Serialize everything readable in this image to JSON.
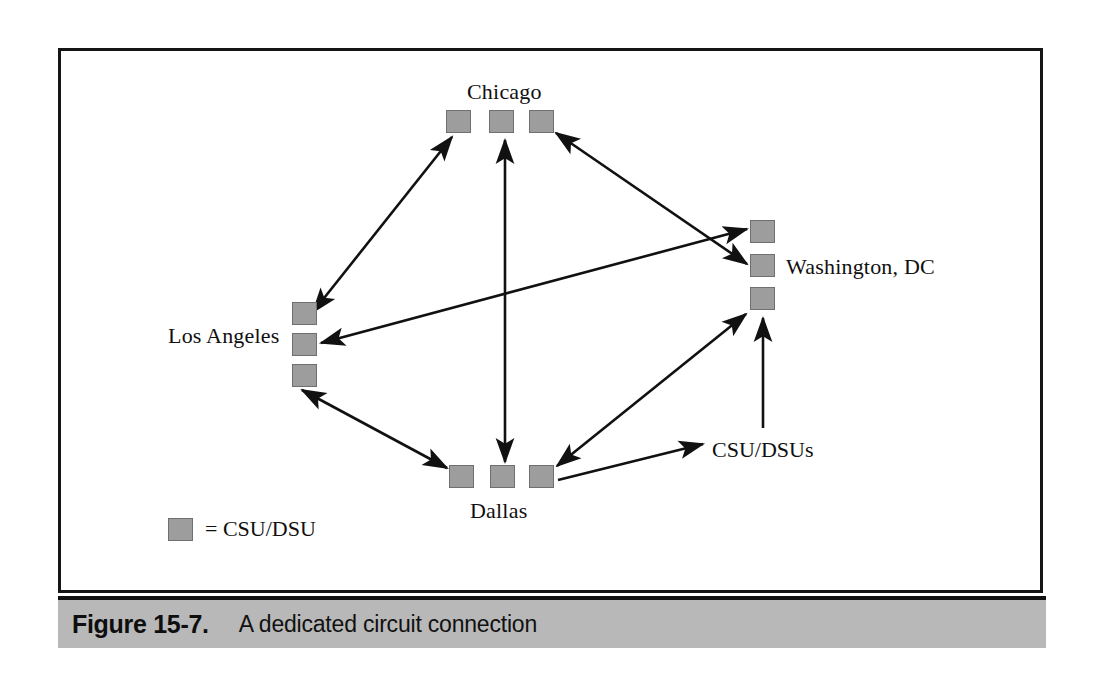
{
  "figure": {
    "caption_number": "Figure 15-7.",
    "caption_text": "A dedicated circuit connection"
  },
  "legend": {
    "swatch_icon": "gray-square-icon",
    "text": "= CSU/DSU"
  },
  "callout": {
    "label": "CSU/DSUs"
  },
  "diagram": {
    "type": "network-topology",
    "node_shape": "square",
    "node_color": "#9d9d9d",
    "node_border_color": "#6f6f6f",
    "line_color": "#111111",
    "sites": [
      {
        "id": "chicago",
        "label": "Chicago",
        "label_position": "above",
        "label_x": 467,
        "label_y": 79,
        "orientation": "horizontal",
        "devices": [
          {
            "x": 446,
            "y": 110
          },
          {
            "x": 489,
            "y": 110
          },
          {
            "x": 529,
            "y": 110
          }
        ]
      },
      {
        "id": "washington-dc",
        "label": "Washington, DC",
        "label_position": "right",
        "label_x": 786,
        "label_y": 254,
        "orientation": "vertical",
        "devices": [
          {
            "x": 750,
            "y": 220
          },
          {
            "x": 750,
            "y": 254
          },
          {
            "x": 750,
            "y": 287
          }
        ]
      },
      {
        "id": "los-angeles",
        "label": "Los Angeles",
        "label_position": "left",
        "label_x": 168,
        "label_y": 323,
        "orientation": "vertical",
        "devices": [
          {
            "x": 292,
            "y": 302
          },
          {
            "x": 292,
            "y": 333
          },
          {
            "x": 292,
            "y": 364
          }
        ]
      },
      {
        "id": "dallas",
        "label": "Dallas",
        "label_position": "below",
        "label_x": 470,
        "label_y": 498,
        "orientation": "horizontal",
        "devices": [
          {
            "x": 449,
            "y": 465
          },
          {
            "x": 490,
            "y": 465
          },
          {
            "x": 529,
            "y": 465
          }
        ]
      }
    ],
    "links": [
      {
        "id": "la-chicago",
        "from": "los-angeles",
        "to": "chicago",
        "arrows": "both",
        "x1": 313,
        "y1": 312,
        "x2": 452,
        "y2": 137
      },
      {
        "id": "chicago-dallas",
        "from": "chicago",
        "to": "dallas",
        "arrows": "both",
        "x1": 505,
        "y1": 140,
        "x2": 505,
        "y2": 462
      },
      {
        "id": "chicago-dc",
        "from": "chicago",
        "to": "washington-dc",
        "arrows": "both",
        "x1": 556,
        "y1": 133,
        "x2": 747,
        "y2": 264
      },
      {
        "id": "la-dc",
        "from": "los-angeles",
        "to": "washington-dc",
        "arrows": "both",
        "x1": 321,
        "y1": 343,
        "x2": 747,
        "y2": 229
      },
      {
        "id": "la-dallas",
        "from": "los-angeles",
        "to": "dallas",
        "arrows": "both",
        "x1": 302,
        "y1": 390,
        "x2": 447,
        "y2": 468
      },
      {
        "id": "dallas-dc",
        "from": "dallas",
        "to": "washington-dc",
        "arrows": "both",
        "x1": 557,
        "y1": 466,
        "x2": 746,
        "y2": 314
      }
    ],
    "callout_leaders": [
      {
        "id": "leader-to-dallas",
        "x1": 703,
        "y1": 444,
        "x2": 558,
        "y2": 480,
        "arrow_at": "start"
      },
      {
        "id": "leader-to-dc",
        "x1": 763,
        "y1": 428,
        "x2": 763,
        "y2": 318,
        "arrow_at": "end"
      }
    ]
  }
}
